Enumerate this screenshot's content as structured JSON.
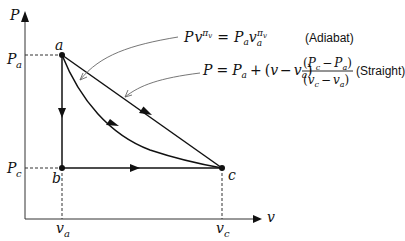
{
  "diagram": {
    "type": "P-v process diagram",
    "axes": {
      "y_label": "P",
      "x_label": "v",
      "y_ticks": [
        "P_a",
        "P_c"
      ],
      "x_ticks": [
        "v_a",
        "v_c"
      ]
    },
    "points": [
      {
        "id": "a",
        "label": "a",
        "P": "P_a",
        "v": "v_a"
      },
      {
        "id": "b",
        "label": "b",
        "P": "P_c",
        "v": "v_a"
      },
      {
        "id": "c",
        "label": "c",
        "P": "P_c",
        "v": "v_c"
      }
    ],
    "paths": [
      {
        "name": "a-to-b",
        "kind": "isochoric (vertical)",
        "direction": "a→b"
      },
      {
        "name": "b-to-c",
        "kind": "isobaric (horizontal)",
        "direction": "b→c"
      },
      {
        "name": "adiabat",
        "kind": "curve",
        "direction": "a→c"
      },
      {
        "name": "straight",
        "kind": "straight line",
        "direction": "a→c"
      }
    ],
    "annotations": {
      "adiabat": {
        "equation": "P v^πv = P_a v_a^πv",
        "tag": "(Adiabat)"
      },
      "straight": {
        "equation": "P = P_a + (v − v_a) (P_c − P_a)/(v_c − v_a)",
        "tag": "(Straight)"
      }
    },
    "text": {
      "P": "P",
      "v": "v",
      "a": "a",
      "b": "b",
      "c": "c",
      "Pa_main": "P",
      "Pa_sub": "a",
      "Pc_main": "P",
      "Pc_sub": "c",
      "va_main": "v",
      "va_sub": "a",
      "vc_main": "v",
      "vc_sub": "c",
      "adiabat_tag": "(Adiabat)",
      "straight_tag": "(Straight)"
    }
  }
}
